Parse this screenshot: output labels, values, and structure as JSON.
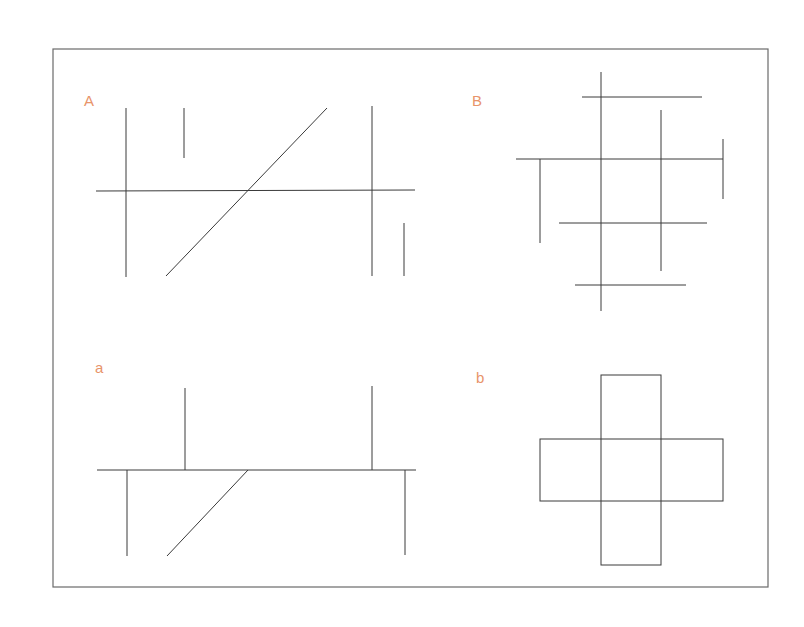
{
  "colors": {
    "label": "#e8946a",
    "line": "#3a3a3a",
    "frame": "#6a6a6a",
    "background": "#ffffff"
  },
  "frame": {
    "x": 53,
    "y": 49,
    "width": 715,
    "height": 538
  },
  "panels": [
    {
      "id": "A",
      "label": "A",
      "label_pos": [
        84,
        106
      ],
      "lines": [
        [
          126,
          108,
          126,
          277
        ],
        [
          184,
          108,
          184,
          158
        ],
        [
          327,
          108,
          166,
          276
        ],
        [
          96,
          191,
          415,
          190
        ],
        [
          372,
          106,
          372,
          276
        ],
        [
          404,
          223,
          404,
          276
        ]
      ]
    },
    {
      "id": "B",
      "label": "B",
      "label_pos": [
        472,
        106
      ],
      "lines": [
        [
          601,
          72,
          601,
          311
        ],
        [
          582,
          97,
          702,
          97
        ],
        [
          661,
          110,
          661,
          271
        ],
        [
          516,
          159,
          723,
          159
        ],
        [
          540,
          159,
          540,
          243
        ],
        [
          723,
          139,
          723,
          199
        ],
        [
          559,
          223,
          707,
          223
        ],
        [
          575,
          285,
          686,
          285
        ]
      ]
    },
    {
      "id": "a",
      "label": "a",
      "label_pos": [
        95,
        373
      ],
      "lines": [
        [
          97,
          470,
          416,
          470
        ],
        [
          185,
          388,
          185,
          470
        ],
        [
          372,
          386,
          372,
          470
        ],
        [
          127,
          470,
          127,
          556
        ],
        [
          248,
          470,
          167,
          556
        ],
        [
          405,
          470,
          405,
          555
        ]
      ]
    },
    {
      "id": "b",
      "label": "b",
      "label_pos": [
        476,
        383
      ],
      "rects": [
        [
          601,
          375,
          60,
          190
        ],
        [
          540,
          439,
          183,
          62
        ]
      ]
    }
  ]
}
